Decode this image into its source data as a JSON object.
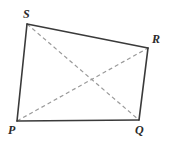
{
  "figure": {
    "kind": "geometry-diagram",
    "shape": "quadrilateral",
    "name": "PQRS",
    "background_color": "#ffffff",
    "canvas": {
      "width": 169,
      "height": 147
    },
    "vertices": [
      {
        "id": "S",
        "label": "S",
        "x": 27,
        "y": 24,
        "label_x": 23,
        "label_y": 8
      },
      {
        "id": "R",
        "label": "R",
        "x": 148,
        "y": 48,
        "label_x": 152,
        "label_y": 33
      },
      {
        "id": "Q",
        "label": "Q",
        "x": 139,
        "y": 120,
        "label_x": 135,
        "label_y": 124
      },
      {
        "id": "P",
        "label": "P",
        "x": 17,
        "y": 121,
        "label_x": 8,
        "label_y": 124
      }
    ],
    "sides": [
      {
        "id": "side-SR",
        "from": "S",
        "to": "R",
        "style": "solid",
        "color": "#3a3a3a",
        "width": 1.6
      },
      {
        "id": "side-RQ",
        "from": "R",
        "to": "Q",
        "style": "solid",
        "color": "#3a3a3a",
        "width": 1.6
      },
      {
        "id": "side-QP",
        "from": "Q",
        "to": "P",
        "style": "solid",
        "color": "#3a3a3a",
        "width": 1.6
      },
      {
        "id": "side-PS",
        "from": "P",
        "to": "S",
        "style": "solid",
        "color": "#3a3a3a",
        "width": 1.6
      }
    ],
    "diagonals": [
      {
        "id": "diagonal-SQ",
        "from": "S",
        "to": "Q",
        "style": "dashed",
        "color": "#9a9a9a",
        "width": 1.2,
        "dash": "4 3"
      },
      {
        "id": "diagonal-PR",
        "from": "P",
        "to": "R",
        "style": "dashed",
        "color": "#9a9a9a",
        "width": 1.2,
        "dash": "4 3"
      }
    ],
    "diagonal_intersection": {
      "x": 88,
      "y": 79
    },
    "colors": {
      "side_stroke": "#3a3a3a",
      "diagonal_stroke": "#9a9a9a",
      "label_text": "#2b2b2b",
      "background": "#ffffff"
    }
  }
}
